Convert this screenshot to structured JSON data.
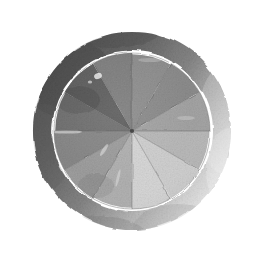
{
  "artwork": {
    "title": "Watercolor Grayscale Color Wheel",
    "medium": "watercolor on paper",
    "background_color": "#ffffff",
    "canvas": {
      "width": 265,
      "height": 265
    },
    "center": {
      "x": 132,
      "y": 131
    }
  },
  "ring": {
    "name": "outer-ring",
    "shape": "hand-painted annulus",
    "inner_radius": 80,
    "outer_radius": 99,
    "base_color": "#6e6e6e",
    "dark_color": "#4a4a4a",
    "faded_color": "#b9b9b9",
    "opacity": 0.95,
    "notes": "darker and denser on the upper-left, fading to pale gray on the right side"
  },
  "gap": {
    "name": "white-gap",
    "color": "#ffffff",
    "inner_radius": 79,
    "outer_radius": 80
  },
  "wheel": {
    "name": "pie-wheel",
    "radius": 78,
    "segment_count": 12,
    "segment_arc_degrees": 30,
    "start_angle_degrees": -90,
    "stroke_color": "#5a5a5a",
    "stroke_width": 0.7
  },
  "chart_data": {
    "type": "pie",
    "title": "Watercolor Grayscale Color Wheel",
    "xlabel": "",
    "ylabel": "",
    "legend": "none",
    "grid": false,
    "categories": [
      "segment-01",
      "segment-02",
      "segment-03",
      "segment-04",
      "segment-05",
      "segment-06",
      "segment-07",
      "segment-08",
      "segment-09",
      "segment-10",
      "segment-11",
      "segment-12"
    ],
    "values": [
      8.333,
      8.333,
      8.333,
      8.333,
      8.333,
      8.333,
      8.333,
      8.333,
      8.333,
      8.333,
      8.333,
      8.333
    ],
    "labels": [
      "12 o'clock",
      "1 o'clock",
      "2 o'clock",
      "3 o'clock",
      "4 o'clock",
      "5 o'clock",
      "6 o'clock",
      "7 o'clock",
      "8 o'clock",
      "9 o'clock",
      "10 o'clock",
      "11 o'clock"
    ],
    "start_angles_deg": [
      -90,
      -60,
      -30,
      0,
      30,
      60,
      90,
      120,
      150,
      180,
      210,
      240
    ],
    "end_angles_deg": [
      -60,
      -30,
      0,
      30,
      60,
      90,
      120,
      150,
      180,
      210,
      240,
      270
    ],
    "colors": [
      "#8d8d8d",
      "#8a8a8a",
      "#a2a2a2",
      "#b8b8b8",
      "#cfcfcf",
      "#d6d6d6",
      "#b0b0b0",
      "#9c9c9c",
      "#868686",
      "#6f6f6f",
      "#5d5d5d",
      "#7e7e7e"
    ],
    "gray_levels": [
      141,
      138,
      162,
      184,
      207,
      214,
      176,
      156,
      134,
      111,
      93,
      126
    ]
  },
  "texture": {
    "name": "paper-grain",
    "opacity": 0.18,
    "speckle_color": "#3a3a3a",
    "highlight_color": "#ffffff"
  }
}
